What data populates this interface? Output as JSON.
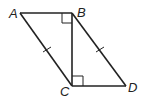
{
  "labels": {
    "A": "A",
    "B": "B",
    "C": "C",
    "D": "D"
  },
  "points": {
    "A": [
      20,
      13
    ],
    "B": [
      72,
      13
    ],
    "C": [
      72,
      86
    ],
    "D": [
      126,
      86
    ]
  },
  "segments": [
    "AB",
    "BC",
    "CD",
    "AC",
    "BD"
  ],
  "marks": {
    "right_angles": [
      "ABC",
      "BCD"
    ],
    "congruent_ticks": [
      "AC",
      "BD"
    ]
  },
  "colors": {
    "stroke": "#222222"
  }
}
